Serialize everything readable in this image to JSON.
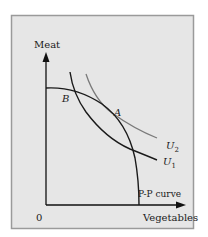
{
  "figure": {
    "background": "#e6e6e6",
    "border_color": "#9a9a9a",
    "axis_color": "#111111",
    "curve_color": "#1a1a1a",
    "u2_color": "#7a7a7a"
  },
  "axes": {
    "y_label": "Meat",
    "x_label": "Vegetables",
    "origin_label": "0"
  },
  "curves": {
    "pp_label": "P-P curve",
    "u1_label": "U",
    "u1_sub": "1",
    "u2_label": "U",
    "u2_sub": "2"
  },
  "points": {
    "a_label": "A",
    "b_label": "B"
  }
}
